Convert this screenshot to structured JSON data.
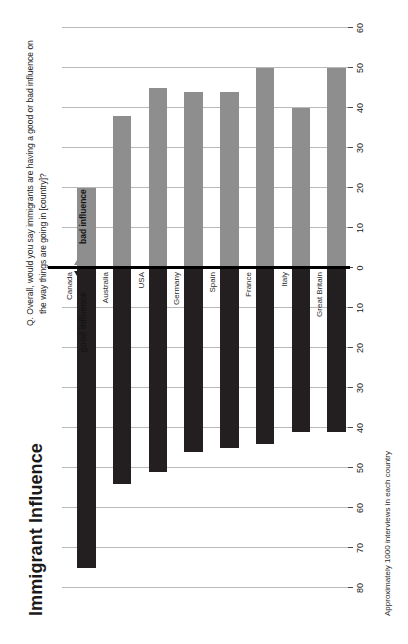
{
  "title": "Immigrant Influence",
  "question": "Q. Overall, would you say immigrants are having a good or bad influence on the way things are going in [country]?",
  "footnote": "Approximately 1000 interviews in each country",
  "legend": {
    "good_label": "good influence",
    "bad_label": "bad influence",
    "good_color": "#231f20",
    "bad_color": "#8e8e8e",
    "good_icon": "triangle-left-icon",
    "bad_icon": "triangle-right-icon"
  },
  "chart_data": {
    "type": "bar",
    "title": "Immigrant Influence",
    "subtitle": "Q. Overall, would you say immigrants are having a good or bad influence on the way things are going in [country]?",
    "orientation": "horizontal-diverging",
    "xlabel": "",
    "ylabel": "",
    "grid": true,
    "legend_position": "top-center",
    "axis_ticks": [
      80,
      70,
      60,
      50,
      40,
      30,
      20,
      10,
      0,
      10,
      20,
      30,
      40,
      50,
      60
    ],
    "axis_left_max": 80,
    "axis_right_max": 60,
    "categories": [
      "Canada",
      "Australia",
      "USA",
      "Germany",
      "Spain",
      "France",
      "Italy",
      "Great Britain"
    ],
    "series": [
      {
        "name": "good influence",
        "color": "#231f20",
        "direction": "left",
        "values": [
          75,
          54,
          51,
          46,
          45,
          44,
          41,
          41
        ]
      },
      {
        "name": "bad influence",
        "color": "#8e8e8e",
        "direction": "right",
        "values": [
          20,
          38,
          45,
          44,
          44,
          50,
          40,
          50
        ]
      }
    ],
    "annotations": [
      "Approximately 1000 interviews in each country"
    ]
  }
}
